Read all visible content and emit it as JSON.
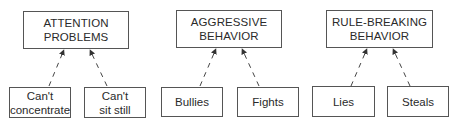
{
  "groups": [
    {
      "label": "ATTENTION\nPROBLEMS",
      "indicators": [
        "Can't\nconcentrate",
        "Can't\nsit still"
      ]
    },
    {
      "label": "AGGRESSIVE\nBEHAVIOR",
      "indicators": [
        "Bullies",
        "Fights"
      ]
    },
    {
      "label": "RULE-BREAKING\nBEHAVIOR",
      "indicators": [
        "Lies",
        "Steals"
      ]
    }
  ],
  "edge_style": "dashed-arrow-upward"
}
